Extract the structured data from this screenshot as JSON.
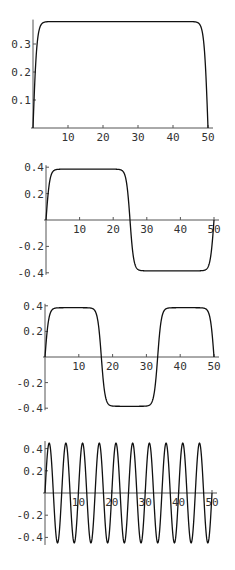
{
  "chart_data": [
    {
      "type": "line",
      "title": "",
      "xlabel": "",
      "ylabel": "",
      "grid": false,
      "legend": null,
      "xlim": [
        0,
        50
      ],
      "ylim": [
        0,
        0.38
      ],
      "x_ticks": [
        10,
        20,
        30,
        40,
        50
      ],
      "x_tick_labels": [
        "10",
        "20",
        "30",
        "40",
        "50"
      ],
      "y_ticks": [
        0.1,
        0.2,
        0.3
      ],
      "y_tick_labels": [
        "0.1",
        "0.2",
        "0.3"
      ],
      "description": "Single plateau: rises steeply from 0 to ~0.38, stays flat, drops to 0 at x=50",
      "series": [
        {
          "name": "mode 1",
          "x": [
            0,
            1,
            2,
            3,
            5,
            10,
            15,
            20,
            25,
            30,
            35,
            40,
            45,
            47,
            48,
            49,
            50
          ],
          "values": [
            0,
            0.25,
            0.34,
            0.37,
            0.38,
            0.38,
            0.38,
            0.38,
            0.38,
            0.38,
            0.38,
            0.38,
            0.38,
            0.37,
            0.34,
            0.25,
            0
          ]
        }
      ],
      "model": {
        "kind": "square",
        "amplitude": 0.38,
        "zeros": [
          0,
          50
        ],
        "sharpness": 1.1
      }
    },
    {
      "type": "line",
      "title": "",
      "xlabel": "",
      "ylabel": "",
      "grid": false,
      "legend": null,
      "xlim": [
        0,
        50
      ],
      "ylim": [
        -0.4,
        0.4
      ],
      "x_ticks": [
        10,
        20,
        30,
        40,
        50
      ],
      "x_tick_labels": [
        "10",
        "20",
        "30",
        "40",
        "50"
      ],
      "y_ticks": [
        0.4,
        0.2,
        -0.2,
        -0.4
      ],
      "y_tick_labels": [
        "0.4",
        "0.2",
        "-0.2",
        "-0.4"
      ],
      "description": "One positive plateau (0-25) then one negative plateau (25-50)",
      "series": [
        {
          "name": "mode 2",
          "x": [
            0,
            1,
            2,
            3,
            5,
            10,
            20,
            22,
            23,
            24,
            25,
            26,
            27,
            28,
            30,
            40,
            47,
            48,
            49,
            50
          ],
          "values": [
            0,
            0.25,
            0.34,
            0.37,
            0.385,
            0.385,
            0.385,
            0.37,
            0.34,
            0.25,
            0,
            -0.25,
            -0.34,
            -0.37,
            -0.385,
            -0.385,
            -0.37,
            -0.34,
            -0.25,
            0
          ]
        }
      ],
      "model": {
        "kind": "square",
        "amplitude": 0.385,
        "zeros": [
          0,
          25,
          50
        ],
        "sharpness": 1.1
      }
    },
    {
      "type": "line",
      "title": "",
      "xlabel": "",
      "ylabel": "",
      "grid": false,
      "legend": null,
      "xlim": [
        0,
        50
      ],
      "ylim": [
        -0.4,
        0.4
      ],
      "x_ticks": [
        10,
        20,
        30,
        40,
        50
      ],
      "x_tick_labels": [
        "10",
        "20",
        "30",
        "40",
        "50"
      ],
      "y_ticks": [
        0.4,
        0.2,
        -0.2,
        -0.4
      ],
      "y_tick_labels": [
        "0.4",
        "0.2",
        "-0.2",
        "-0.4"
      ],
      "description": "Positive plateau (0-16.7), negative plateau (16.7-33.3), positive plateau (33.3-50)",
      "series": [
        {
          "name": "mode 3",
          "x": [
            0,
            1,
            3,
            8,
            14,
            16.7,
            19,
            25,
            31,
            33.3,
            36,
            42,
            48,
            50
          ],
          "values": [
            0,
            0.25,
            0.37,
            0.385,
            0.37,
            0,
            -0.37,
            -0.385,
            -0.37,
            0,
            0.37,
            0.385,
            0.34,
            0
          ]
        }
      ],
      "model": {
        "kind": "square",
        "amplitude": 0.385,
        "zeros": [
          0,
          16.667,
          33.333,
          50
        ],
        "sharpness": 1.1
      }
    },
    {
      "type": "line",
      "title": "",
      "xlabel": "",
      "ylabel": "",
      "grid": false,
      "legend": null,
      "xlim": [
        0,
        50
      ],
      "ylim": [
        -0.45,
        0.45
      ],
      "x_ticks": [
        10,
        20,
        30,
        40,
        50
      ],
      "x_tick_labels": [
        "10",
        "20",
        "30",
        "40",
        "50"
      ],
      "y_ticks": [
        0.4,
        0.2,
        -0.2,
        -0.4
      ],
      "y_tick_labels": [
        "0.4",
        "0.2",
        "-0.2",
        "-0.4"
      ],
      "description": "Sinusoid with 10 full periods over 0-50, amplitude ~0.45",
      "series": [
        {
          "name": "mode 4",
          "x": [
            0,
            1.25,
            2.5,
            3.75,
            5,
            6.25,
            7.5,
            8.75,
            10,
            46.25,
            47.5,
            48.75,
            50
          ],
          "values": [
            0,
            0.45,
            0,
            -0.45,
            0,
            0.45,
            0,
            -0.45,
            0,
            0.45,
            0,
            -0.45,
            0
          ]
        }
      ],
      "model": {
        "kind": "sine",
        "amplitude": 0.45,
        "period": 5
      }
    }
  ],
  "layout": {
    "panels": [
      {
        "x0": 33,
        "x50": 208,
        "y_zero": 128,
        "px_per_unit_y": 280
      },
      {
        "x0": 46,
        "x50": 214,
        "y_zero": 220,
        "px_per_unit_y": 132
      },
      {
        "x0": 45,
        "x50": 214,
        "y_zero": 357,
        "px_per_unit_y": 128
      },
      {
        "x0": 45,
        "x50": 212,
        "y_zero": 493,
        "px_per_unit_y": 111
      }
    ]
  },
  "colors": {
    "curve": "#111111",
    "axis": "#555555",
    "text": "#333333",
    "background": "#ffffff"
  }
}
